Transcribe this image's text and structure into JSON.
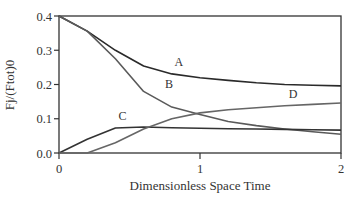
{
  "chart_data": {
    "type": "line",
    "title": "",
    "xlabel": "Dimensionless Space Time",
    "ylabel": "Fj/(Ftot)0",
    "xlim": [
      0,
      2
    ],
    "ylim": [
      0,
      0.4
    ],
    "grid": false,
    "legend": "inline labels",
    "x_ticks": [
      "0",
      "1",
      "2"
    ],
    "y_ticks": [
      "0.0",
      "0.1",
      "0.2",
      "0.3",
      "0.4"
    ],
    "x": [
      0,
      0.2,
      0.4,
      0.6,
      0.8,
      1.0,
      1.2,
      1.4,
      1.6,
      1.8,
      2.0
    ],
    "series": [
      {
        "name": "A",
        "color": "#2a2a2a",
        "values": [
          0.4,
          0.356,
          0.3,
          0.254,
          0.231,
          0.22,
          0.212,
          0.205,
          0.2,
          0.198,
          0.196
        ],
        "label_pos": [
          0.85,
          0.255
        ]
      },
      {
        "name": "B",
        "color": "#5a5a5a",
        "values": [
          0.4,
          0.356,
          0.275,
          0.18,
          0.134,
          0.112,
          0.092,
          0.08,
          0.07,
          0.062,
          0.055
        ],
        "label_pos": [
          0.78,
          0.19
        ]
      },
      {
        "name": "C",
        "color": "#333333",
        "values": [
          0.0,
          0.04,
          0.073,
          0.076,
          0.074,
          0.072,
          0.071,
          0.07,
          0.069,
          0.068,
          0.067
        ],
        "label_pos": [
          0.45,
          0.095
        ]
      },
      {
        "name": "D",
        "color": "#666666",
        "values": [
          0.0,
          0.0,
          0.03,
          0.07,
          0.1,
          0.117,
          0.126,
          0.132,
          0.138,
          0.142,
          0.146
        ],
        "label_pos": [
          1.66,
          0.16
        ]
      }
    ]
  },
  "axes": {
    "xlabel": "Dimensionless Space Time",
    "ylabel": "Fj/(Ftot)0"
  }
}
